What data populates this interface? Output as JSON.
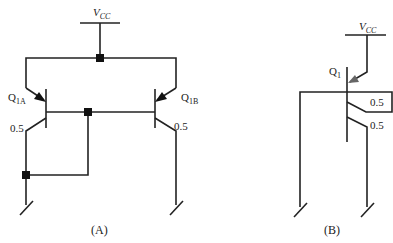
{
  "figure_a": {
    "caption": "(A)",
    "supply": {
      "main": "V",
      "sub": "CC"
    },
    "transistor_left": {
      "main": "Q",
      "sub": "1A"
    },
    "transistor_right": {
      "main": "Q",
      "sub": "1B"
    },
    "emitter_ratio_left": "0.5",
    "emitter_ratio_right": "0.5"
  },
  "figure_b": {
    "caption": "(B)",
    "supply": {
      "main": "V",
      "sub": "CC"
    },
    "transistor": {
      "main": "Q",
      "sub": "1"
    },
    "collector_ratio_upper": "0.5",
    "collector_ratio_lower": "0.5"
  },
  "colors": {
    "line": "#222222",
    "arrow_b": "#666666"
  }
}
